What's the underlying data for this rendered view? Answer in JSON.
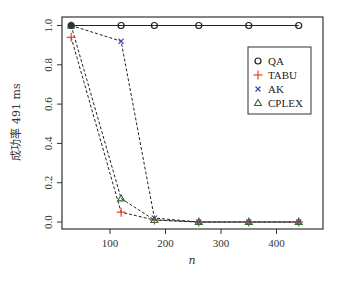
{
  "chart_data": {
    "type": "line",
    "title": "",
    "xlabel": "n",
    "ylabel": "成功率 491 ms",
    "x": [
      30,
      120,
      180,
      260,
      350,
      440
    ],
    "xlim": [
      20,
      455
    ],
    "ylim": [
      -0.03,
      1.03
    ],
    "xticks": [
      100,
      200,
      300,
      400
    ],
    "yticks": [
      0.0,
      0.2,
      0.4,
      0.6,
      0.8,
      1.0
    ],
    "xtick_labels": [
      "100",
      "200",
      "300",
      "400"
    ],
    "ytick_labels": [
      "0.0",
      "0.2",
      "0.4",
      "0.6",
      "0.8",
      "1.0"
    ],
    "grid": false,
    "legend_position": "upper right",
    "series": [
      {
        "name": "QA",
        "marker": "circle",
        "line": "solid",
        "color": "#222222",
        "values": [
          1.0,
          1.0,
          1.0,
          1.0,
          1.0,
          1.0
        ]
      },
      {
        "name": "TABU",
        "marker": "plus",
        "line": "dashed",
        "color": "#e0442c",
        "values": [
          0.94,
          0.05,
          0.01,
          0.0,
          0.0,
          0.0
        ]
      },
      {
        "name": "AK",
        "marker": "x",
        "line": "dashed",
        "color": "#4a4aa8",
        "values": [
          1.0,
          0.92,
          0.02,
          0.0,
          0.0,
          0.0
        ]
      },
      {
        "name": "CPLEX",
        "marker": "triangle",
        "line": "dashed",
        "color": "#2f6b3a",
        "values": [
          1.0,
          0.12,
          0.01,
          0.0,
          0.0,
          0.0
        ]
      }
    ]
  },
  "legend": {
    "items": [
      "QA",
      "TABU",
      "AK",
      "CPLEX"
    ]
  },
  "axes": {
    "xlabel": "n",
    "ylabel": "成功率 491 ms"
  }
}
